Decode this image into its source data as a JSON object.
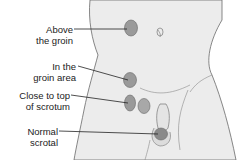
{
  "diagram": {
    "labels": [
      {
        "id": "above-groin",
        "lines": [
          "Above",
          "the groin"
        ]
      },
      {
        "id": "groin-area",
        "lines": [
          "In the",
          "groin area"
        ]
      },
      {
        "id": "top-scrotum",
        "lines": [
          "Close to top",
          "of scrotum"
        ]
      },
      {
        "id": "normal-scrotal",
        "lines": [
          "Normal",
          "scrotal"
        ]
      }
    ],
    "colors": {
      "skin": "#ececec",
      "outline": "#6a6a6a",
      "testis_fill": "#9a9a9a",
      "line": "#222222"
    }
  }
}
